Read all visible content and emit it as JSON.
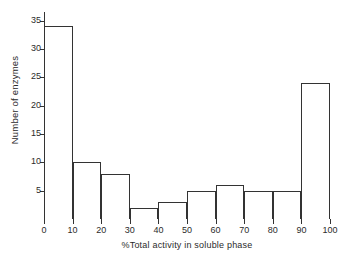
{
  "chart_data": {
    "type": "bar",
    "title": "",
    "xlabel": "%Total activity in soluble phase",
    "ylabel": "Number of enzymes",
    "categories": [
      "0-10",
      "10-20",
      "20-30",
      "30-40",
      "40-50",
      "50-60",
      "60-70",
      "70-80",
      "80-90",
      "90-100"
    ],
    "bin_edges": [
      0,
      10,
      20,
      30,
      40,
      50,
      60,
      70,
      80,
      90,
      100
    ],
    "values": [
      34,
      10,
      8,
      2,
      3,
      5,
      6,
      5,
      5,
      24
    ],
    "xlim": [
      0,
      100
    ],
    "ylim": [
      0,
      36.5
    ],
    "x_ticks": [
      0,
      10,
      20,
      30,
      40,
      50,
      60,
      70,
      80,
      90,
      100
    ],
    "x_tick_labels": [
      "0",
      "10",
      "20",
      "30",
      "40",
      "50",
      "60",
      "70",
      "80",
      "90",
      "100"
    ],
    "y_ticks": [
      5,
      10,
      15,
      20,
      25,
      30,
      35
    ],
    "y_tick_labels": [
      "5",
      "10",
      "15",
      "20",
      "25",
      "30",
      "35"
    ],
    "grid": false,
    "legend": false,
    "line_color": "#333333",
    "fill_color": "#ffffff",
    "background": "#ffffff"
  }
}
